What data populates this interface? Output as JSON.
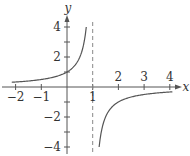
{
  "chart_data": {
    "type": "line",
    "title": "",
    "function": "y = 1/(1 - x)",
    "xlabel": "x",
    "ylabel": "y",
    "xlim": [
      -2.2,
      4.3
    ],
    "ylim": [
      -4.3,
      4.9
    ],
    "x_ticks": [
      -2,
      -1,
      1,
      2,
      3,
      4
    ],
    "x_tick_labels": [
      "−2",
      "−1",
      "1",
      "2",
      "3",
      "4"
    ],
    "y_ticks": [
      4,
      2,
      -2,
      -4
    ],
    "y_tick_labels": [
      "4",
      "2",
      "−2",
      "−4"
    ],
    "minor_y_ticks": [
      3,
      1,
      -1,
      -3
    ],
    "asymptote": {
      "type": "vertical",
      "x": 1,
      "style": "dashed"
    },
    "series": [
      {
        "name": "left-branch",
        "x": [
          -2,
          -1.5,
          -1,
          -0.5,
          0,
          0.25,
          0.5,
          0.6,
          0.7,
          0.75
        ],
        "y": [
          0.333,
          0.4,
          0.5,
          0.667,
          1,
          1.333,
          2,
          2.5,
          3.333,
          4
        ]
      },
      {
        "name": "right-branch",
        "x": [
          1.25,
          1.3,
          1.4,
          1.5,
          2,
          2.5,
          3,
          3.5,
          4
        ],
        "y": [
          -4,
          -3.333,
          -2.5,
          -2,
          -1,
          -0.667,
          -0.5,
          -0.4,
          -0.333
        ]
      }
    ],
    "grid": false,
    "legend": null,
    "colors": {
      "curve": "#555555",
      "axis": "#555555",
      "asymptote": "#888888"
    }
  }
}
